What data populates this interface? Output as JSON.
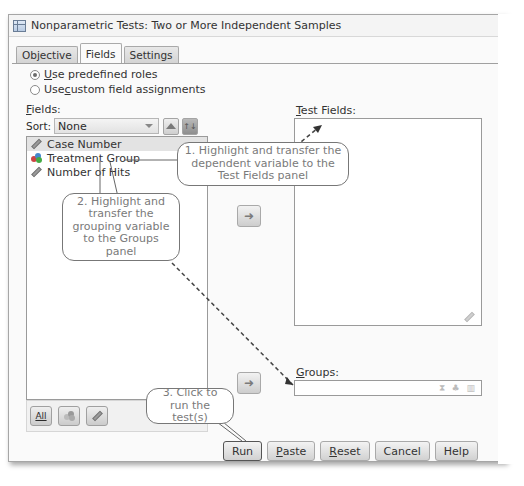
{
  "window": {
    "title": "Nonparametric Tests: Two or More Independent Samples"
  },
  "tabs": [
    {
      "label": "Objective",
      "active": false
    },
    {
      "label": "Fields",
      "active": true
    },
    {
      "label": "Settings",
      "active": false
    }
  ],
  "roles": {
    "predefined": {
      "pre": "",
      "u": "U",
      "post": "se predefined roles",
      "checked": true
    },
    "custom": {
      "pre": "Use ",
      "u": "c",
      "post": "ustom field assignments",
      "checked": false
    }
  },
  "fields_panel": {
    "label_u": "F",
    "label_rest": "ields:",
    "sort_label": "Sort:",
    "sort_value": "None",
    "items": [
      {
        "label": "Case Number",
        "icon": "scale-ruler-icon",
        "selected": true
      },
      {
        "label": "Treatment Group",
        "icon": "nominal-icon",
        "selected": false
      },
      {
        "label": "Number of Hits",
        "icon": "scale-ruler-icon",
        "selected": false
      }
    ],
    "footer_buttons": [
      {
        "label": "All",
        "name": "all-button"
      },
      {
        "label": "",
        "name": "nominal-filter-button"
      },
      {
        "label": "",
        "name": "scale-filter-button"
      }
    ]
  },
  "test_fields": {
    "label_u": "T",
    "label_rest": "est Fields:"
  },
  "groups": {
    "label_u": "G",
    "label_rest": "roups:"
  },
  "transfer_arrow": "➜",
  "groups_icons": "⧗ ♣ ▥",
  "buttons": {
    "run": {
      "pre": "Run",
      "u": "",
      "post": ""
    },
    "paste": {
      "pre": "",
      "u": "P",
      "post": "aste"
    },
    "reset": {
      "pre": "",
      "u": "R",
      "post": "eset"
    },
    "cancel": {
      "pre": "Cancel",
      "u": "",
      "post": ""
    },
    "help": {
      "pre": "Help",
      "u": "",
      "post": ""
    }
  },
  "callouts": {
    "one": "1. Highlight and transfer the dependent variable to the Test Fields panel",
    "two": "2. Highlight and transfer the grouping variable to the Groups panel",
    "three": "3. Click to run the test(s)"
  }
}
